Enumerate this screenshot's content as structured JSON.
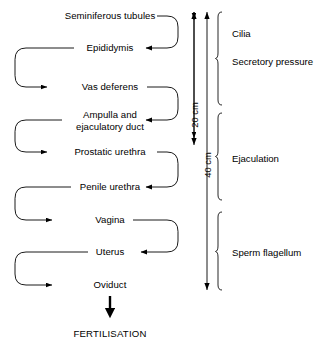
{
  "diagram": {
    "stroke_color": "#000000",
    "background_color": "#ffffff",
    "nodes": [
      {
        "id": "seminiferous-tubules",
        "label": "Seminiferous tubules",
        "x": 110,
        "y": 16,
        "exit": "right"
      },
      {
        "id": "epididymis",
        "label": "Epididymis",
        "x": 110,
        "y": 48,
        "exit": "left"
      },
      {
        "id": "vas-deferens",
        "label": "Vas deferens",
        "x": 110,
        "y": 87,
        "exit": "right"
      },
      {
        "id": "ampulla-ejaculatory-duct",
        "label": "Ampulla and\nejaculatory duct",
        "x": 110,
        "y": 120,
        "exit": "left"
      },
      {
        "id": "prostatic-urethra",
        "label": "Prostatic urethra",
        "x": 110,
        "y": 152,
        "exit": "right"
      },
      {
        "id": "penile-urethra",
        "label": "Penile urethra",
        "x": 110,
        "y": 187,
        "exit": "left"
      },
      {
        "id": "vagina",
        "label": "Vagina",
        "x": 110,
        "y": 220,
        "exit": "right"
      },
      {
        "id": "uterus",
        "label": "Uterus",
        "x": 110,
        "y": 252,
        "exit": "left"
      },
      {
        "id": "oviduct",
        "label": "Oviduct",
        "x": 110,
        "y": 285,
        "exit": "none"
      }
    ],
    "outcome": {
      "id": "fertilisation",
      "label": "FERTILISATION",
      "x": 110,
      "y": 333
    },
    "measures": [
      {
        "id": "measure-20cm",
        "label": "20 cm",
        "value": 20,
        "unit": "cm",
        "x": 194,
        "y_top": 12,
        "y_bottom": 145,
        "arrowheads": "both"
      },
      {
        "id": "measure-40cm",
        "label": "40 cm",
        "value": 40,
        "unit": "cm",
        "x": 207,
        "y_top": 12,
        "y_bottom": 290,
        "arrowheads": "both"
      }
    ],
    "phases": [
      {
        "id": "phase-cilia",
        "label": "Cilia",
        "label_y": 33,
        "bracket_top": 12,
        "bracket_bottom": 105
      },
      {
        "id": "phase-secretory-pressure",
        "label": "Secretory pressure",
        "label_y": 61,
        "bracket_top": 12,
        "bracket_bottom": 105
      },
      {
        "id": "phase-ejaculation",
        "label": "Ejaculation",
        "label_y": 158,
        "bracket_top": 113,
        "bracket_bottom": 200
      },
      {
        "id": "phase-sperm-flagellum",
        "label": "Sperm flagellum",
        "label_y": 252,
        "bracket_top": 212,
        "bracket_bottom": 290
      }
    ]
  }
}
